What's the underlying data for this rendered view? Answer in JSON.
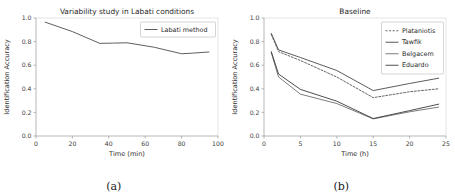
{
  "figure": {
    "subfigures": [
      {
        "caption": "(a)"
      },
      {
        "caption": "(b)"
      }
    ]
  },
  "chart_data": [
    {
      "type": "line",
      "title": "Variability study in Labati conditions",
      "xlabel": "Time (min)",
      "ylabel": "Identification Accuracy",
      "xlim": [
        0,
        100
      ],
      "ylim": [
        0.0,
        1.0
      ],
      "xticks": [
        0,
        20,
        40,
        60,
        80,
        100
      ],
      "yticks": [
        0.0,
        0.2,
        0.4,
        0.6,
        0.8,
        1.0
      ],
      "xtick_labels": [
        "0",
        "20",
        "40",
        "60",
        "80",
        "100"
      ],
      "ytick_labels": [
        "0.0",
        "0.2",
        "0.4",
        "0.6",
        "0.8",
        "1.0"
      ],
      "grid": false,
      "legend_position": "upper right",
      "series": [
        {
          "name": "Labati method",
          "color": "#4d4d4d",
          "dash": "none",
          "x": [
            5,
            20,
            35,
            42,
            50,
            65,
            80,
            86,
            95
          ],
          "values": [
            0.965,
            0.885,
            0.785,
            0.787,
            0.79,
            0.752,
            0.697,
            0.702,
            0.712
          ]
        }
      ]
    },
    {
      "type": "line",
      "title": "Baseline",
      "xlabel": "Time (h)",
      "ylabel": "Identification Accuracy",
      "xlim": [
        0,
        25
      ],
      "ylim": [
        0.0,
        1.0
      ],
      "xticks": [
        0,
        5,
        10,
        15,
        20,
        25
      ],
      "yticks": [
        0.0,
        0.2,
        0.4,
        0.6,
        0.8,
        1.0
      ],
      "xtick_labels": [
        "0",
        "5",
        "10",
        "15",
        "20",
        "25"
      ],
      "ytick_labels": [
        "0.0",
        "0.2",
        "0.4",
        "0.6",
        "0.8",
        "1.0"
      ],
      "grid": false,
      "legend_position": "upper right",
      "series": [
        {
          "name": "Plataniotis",
          "color": "#555555",
          "dash": "2,1.6",
          "x": [
            1,
            2,
            5,
            10,
            15,
            20,
            24
          ],
          "values": [
            0.86,
            0.715,
            0.64,
            0.5,
            0.325,
            0.375,
            0.4
          ]
        },
        {
          "name": "Tawfik",
          "color": "#4a4a4a",
          "dash": "none",
          "x": [
            1,
            2,
            5,
            10,
            15,
            20,
            24
          ],
          "values": [
            0.87,
            0.73,
            0.665,
            0.555,
            0.385,
            0.445,
            0.49
          ]
        },
        {
          "name": "Belgacem",
          "color": "#6e6e6e",
          "dash": "none",
          "x": [
            1,
            2,
            5,
            10,
            15,
            20,
            24
          ],
          "values": [
            0.705,
            0.5,
            0.355,
            0.275,
            0.145,
            0.205,
            0.245
          ]
        },
        {
          "name": "Eduardo",
          "color": "#3a3a3a",
          "dash": "none",
          "x": [
            1,
            2,
            5,
            10,
            15,
            20,
            24
          ],
          "values": [
            0.715,
            0.525,
            0.395,
            0.295,
            0.148,
            0.215,
            0.27
          ]
        }
      ]
    }
  ]
}
